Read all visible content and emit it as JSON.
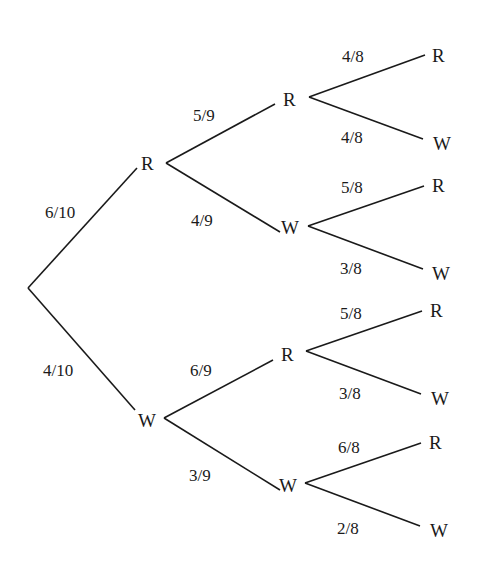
{
  "diagram": {
    "type": "probability-tree",
    "root": "start",
    "level1": [
      {
        "label": "R",
        "prob": "6/10"
      },
      {
        "label": "W",
        "prob": "4/10"
      }
    ],
    "level2": [
      {
        "parent": "R",
        "label": "R",
        "prob": "5/9"
      },
      {
        "parent": "R",
        "label": "W",
        "prob": "4/9"
      },
      {
        "parent": "W",
        "label": "R",
        "prob": "6/9"
      },
      {
        "parent": "W",
        "label": "W",
        "prob": "3/9"
      }
    ],
    "level3": [
      {
        "path": "RR",
        "label": "R",
        "prob": "4/8"
      },
      {
        "path": "RR",
        "label": "W",
        "prob": "4/8"
      },
      {
        "path": "RW",
        "label": "R",
        "prob": "5/8"
      },
      {
        "path": "RW",
        "label": "W",
        "prob": "3/8"
      },
      {
        "path": "WR",
        "label": "R",
        "prob": "5/8"
      },
      {
        "path": "WR",
        "label": "W",
        "prob": "3/8"
      },
      {
        "path": "WW",
        "label": "R",
        "prob": "6/8"
      },
      {
        "path": "WW",
        "label": "W",
        "prob": "2/8"
      }
    ]
  }
}
